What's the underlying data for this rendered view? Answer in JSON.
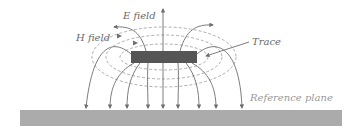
{
  "diagram": {
    "labels": {
      "e_field": "E field",
      "h_field": "H field",
      "trace": "Trace",
      "reference_plane": "Reference plane"
    },
    "colors": {
      "trace_fill": "#555555",
      "reference_plane_fill": "#ababab",
      "field_line": "#6e6e6e",
      "dashed_line": "#9a9a9a",
      "label_text": "#6a6a6a",
      "reference_label_text": "#9a9a9a"
    },
    "elements": {
      "trace": {
        "x": 131,
        "y": 51,
        "width": 66,
        "height": 12
      },
      "reference_plane": {
        "x": 20,
        "y": 110,
        "width": 322,
        "height": 16
      }
    }
  }
}
